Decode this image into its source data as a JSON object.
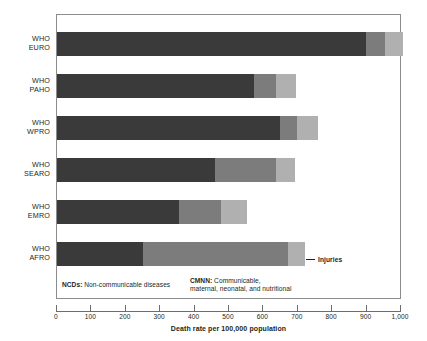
{
  "chart_data": {
    "type": "bar",
    "orientation": "horizontal",
    "stacked": true,
    "title": "",
    "xlabel": "Death rate per 100,000 population",
    "ylabel": "",
    "xlim": [
      0,
      1000
    ],
    "xticks": [
      0,
      100,
      200,
      300,
      400,
      500,
      600,
      700,
      800,
      900,
      1000
    ],
    "xtick_labels": [
      "0",
      "100",
      "200",
      "300",
      "400",
      "500",
      "600",
      "700",
      "800",
      "900",
      "1,000"
    ],
    "grid": false,
    "legend_position": "inside-bottom",
    "categories": [
      "WHO EURO",
      "WHO PAHO",
      "WHO WPRO",
      "WHO SEARO",
      "WHO EMRO",
      "WHO AFRO"
    ],
    "category_lines": [
      {
        "l1": "WHO",
        "l2": "EURO"
      },
      {
        "l1": "WHO",
        "l2": "PAHO"
      },
      {
        "l1": "WHO",
        "l2": "WPRO"
      },
      {
        "l1": "WHO",
        "l2": "SEARO"
      },
      {
        "l1": "WHO",
        "l2": "EMRO"
      },
      {
        "l1": "WHO",
        "l2": "AFRO"
      }
    ],
    "series": [
      {
        "name": "NCDs",
        "color": "#3a3a3a",
        "values": [
          898,
          573,
          648,
          459,
          355,
          250
        ]
      },
      {
        "name": "CMNN",
        "color": "#7c7c7c",
        "values": [
          55,
          64,
          50,
          178,
          122,
          422
        ]
      },
      {
        "name": "Injuries",
        "color": "#b0b0b0",
        "values": [
          52,
          58,
          61,
          55,
          75,
          49
        ]
      }
    ],
    "totals": [
      1005,
      695,
      759,
      692,
      552,
      721
    ],
    "annotations": [
      {
        "name": "injuries-callout",
        "text": "Injuries",
        "target_series": "Injuries",
        "target_category": "WHO AFRO"
      }
    ]
  },
  "legend": {
    "ncds": {
      "abbr": "NCDs:",
      "text": " Non-communicable diseases"
    },
    "cmnn": {
      "abbr": "CMNN:",
      "text": " Communicable,",
      "line2": "maternal, neonatal, and nutritional"
    }
  },
  "axis": {
    "title": "Death rate per 100,000 population"
  },
  "callout": {
    "injuries_label": "Injuries"
  }
}
